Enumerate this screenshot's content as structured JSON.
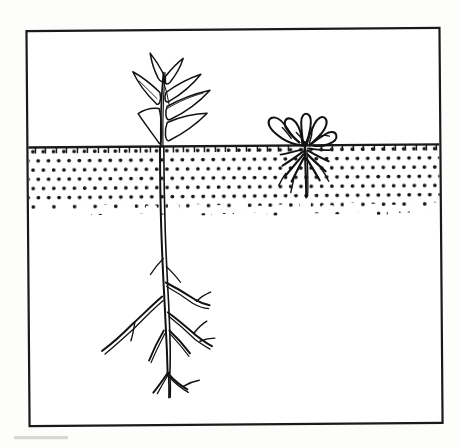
{
  "figure": {
    "kind": "line-drawing",
    "description": "Black ink botanical illustration inside a rectangular frame showing two plants growing in a dotted soil cross-section. The left plant is large and healthy with lanceolate leaves and a deep branching taproot. The right plant is small and stunted with curled crinkled leaves and short shallow roots confined to the topsoil layer.",
    "frame": {
      "stroke_color": "#1a1a1a",
      "stroke_width": 2.2,
      "x": 27,
      "y": 28,
      "width": 415,
      "height": 398
    },
    "background_color": "#fdfdfc",
    "ink_color": "#111111"
  },
  "scene": {
    "soil": {
      "label": "topsoil-layer",
      "surface_line_y": 146,
      "bottom_y_nominal": 222,
      "fill_pattern": "dot-stipple",
      "dot_color": "#171717",
      "dot_radius": 1.9,
      "dot_spacing_x": 10.3,
      "dot_spacing_y": 9.2,
      "surface_line_color": "#1a1a1a",
      "surface_line_width": 2.4,
      "tick_marks": true,
      "tick_length": 5
    },
    "air_region": {
      "label": "above-ground-region",
      "top_y": 30,
      "bottom_y": 146,
      "fill": "#ffffff"
    },
    "subsoil_region": {
      "label": "subsoil-region",
      "top_y": 222,
      "bottom_y": 424,
      "fill": "#ffffff"
    }
  },
  "plants": [
    {
      "id": "healthy-plant",
      "name": "healthy-plant-deep-taproot",
      "position_x": 162,
      "crown_y": 146,
      "shoot_height_px": 82,
      "root_depth_px": 240,
      "leaf_count": 7,
      "root_order": "taproot with lateral branches",
      "condition": "vigorous",
      "penetrates_subsoil": true
    },
    {
      "id": "stunted-plant",
      "name": "stunted-plant-shallow-roots",
      "position_x": 305,
      "crown_y": 146,
      "shoot_height_px": 33,
      "root_depth_px": 50,
      "leaf_count": 6,
      "root_order": "short fibrous cluster",
      "condition": "stunted, leaves curled",
      "penetrates_subsoil": false
    }
  ],
  "artifacts": {
    "scan_smudge": {
      "name": "scan-smudge-bottom-left",
      "x": 14,
      "y": 436,
      "width": 54,
      "height": 4,
      "color": "#c9c9c9"
    }
  },
  "text": {
    "has_text": false,
    "labels": []
  }
}
